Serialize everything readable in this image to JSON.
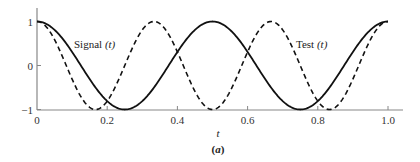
{
  "chart_data": {
    "type": "line",
    "title": "",
    "caption": "(a)",
    "xlabel": "t",
    "ylabel": "",
    "xlim": [
      0,
      1.0
    ],
    "ylim": [
      -1,
      1
    ],
    "grid": false,
    "legend": "none (inline annotations)",
    "x_ticks": [
      0,
      0.2,
      0.4,
      0.6,
      0.8,
      1.0
    ],
    "x_tick_labels": [
      "0",
      "0.2",
      "0.4",
      "0.6",
      "0.8",
      "1.0"
    ],
    "y_ticks": [
      -1,
      0,
      1
    ],
    "y_tick_labels": [
      "−1",
      "0",
      "1"
    ],
    "series": [
      {
        "name": "Signal (t)",
        "style": "solid",
        "color": "#111111",
        "function": "cos(4*pi*t)",
        "x": [
          0,
          0.05,
          0.1,
          0.125,
          0.15,
          0.2,
          0.25,
          0.3,
          0.35,
          0.375,
          0.4,
          0.45,
          0.5,
          0.55,
          0.6,
          0.625,
          0.65,
          0.7,
          0.75,
          0.8,
          0.85,
          0.875,
          0.9,
          0.95,
          1.0
        ],
        "values": [
          1,
          0.81,
          0.31,
          0,
          -0.31,
          -0.81,
          -1,
          -0.81,
          -0.31,
          0,
          0.31,
          0.81,
          1,
          0.81,
          0.31,
          0,
          -0.31,
          -0.81,
          -1,
          -0.81,
          -0.31,
          0,
          0.31,
          0.81,
          1
        ]
      },
      {
        "name": "Test (t)",
        "style": "dashed",
        "color": "#111111",
        "function": "cos(6*pi*t)",
        "x": [
          0,
          0.0833,
          0.1667,
          0.25,
          0.3333,
          0.4167,
          0.5,
          0.5833,
          0.6667,
          0.75,
          0.8333,
          0.9167,
          1.0
        ],
        "values": [
          1,
          0,
          -1,
          0,
          1,
          0,
          -1,
          0,
          1,
          0,
          -1,
          0,
          1
        ]
      }
    ],
    "annotations": [
      {
        "text": "Signal (t)",
        "x": 0.13,
        "y": 0.45
      },
      {
        "text": "Test (t)",
        "x": 0.79,
        "y": 0.45
      }
    ]
  },
  "labels": {
    "signal_name": "Signal ",
    "test_name": "Test ",
    "t_paren": "(t)",
    "xlabel": "t",
    "caption": "(a)"
  }
}
